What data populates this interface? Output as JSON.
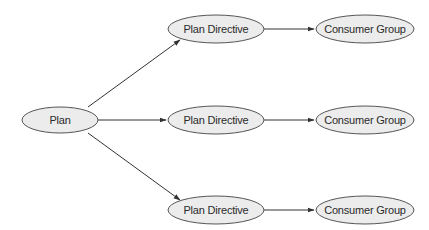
{
  "diagram": {
    "type": "flow-tree",
    "colors": {
      "node_fill": "#ececec",
      "node_stroke": "#555555",
      "edge": "#333333",
      "text": "#2a2a2a",
      "background": "#ffffff"
    },
    "nodes": {
      "plan": {
        "label": "Plan"
      },
      "directive_1": {
        "label": "Plan Directive"
      },
      "directive_2": {
        "label": "Plan Directive"
      },
      "directive_3": {
        "label": "Plan Directive"
      },
      "group_1": {
        "label": "Consumer Group"
      },
      "group_2": {
        "label": "Consumer Group"
      },
      "group_3": {
        "label": "Consumer Group"
      }
    },
    "edges": [
      {
        "from": "plan",
        "to": "directive_1"
      },
      {
        "from": "plan",
        "to": "directive_2"
      },
      {
        "from": "plan",
        "to": "directive_3"
      },
      {
        "from": "directive_1",
        "to": "group_1"
      },
      {
        "from": "directive_2",
        "to": "group_2"
      },
      {
        "from": "directive_3",
        "to": "group_3"
      }
    ]
  }
}
